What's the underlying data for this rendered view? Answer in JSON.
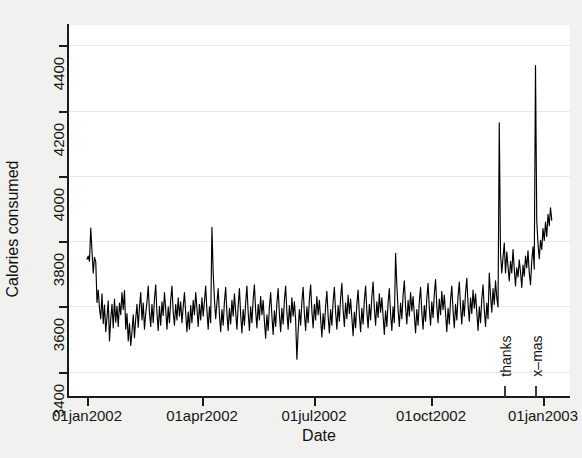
{
  "chart_data": {
    "type": "line",
    "title": "",
    "xlabel": "Date",
    "ylabel": "Calories consumed",
    "grid": true,
    "legend": "none",
    "line_color": "#000000",
    "background_color": "#ffffff",
    "figure_background_color": "#f1f1f0",
    "x_type": "date",
    "xlim": [
      "01jan2002",
      "15jan2003"
    ],
    "ylim": [
      3320,
      4460
    ],
    "y_ticks": [
      3400,
      3600,
      3800,
      4000,
      4200,
      4400
    ],
    "y_tick_labels": [
      "3400",
      "3600",
      "3800",
      "4000",
      "4200",
      "4400"
    ],
    "x_ticks": [
      "01jan2002",
      "01apr2002",
      "01jul2002",
      "01oct2002",
      "01jan2003"
    ],
    "x_tick_labels": [
      "01jan2002",
      "01apr2002",
      "01jul2002",
      "01oct2002",
      "01jan2003"
    ],
    "annotations": [
      {
        "label": "thanks",
        "x": "28nov2002",
        "orientation": "vertical"
      },
      {
        "label": "x–mas",
        "x": "25dec2002",
        "orientation": "vertical"
      }
    ],
    "series": [
      {
        "name": "Calories consumed",
        "x_start": "01jan2002",
        "x_step_days": 1,
        "values": [
          3742,
          3752,
          3736,
          3838,
          3766,
          3700,
          3748,
          3735,
          3610,
          3648,
          3592,
          3560,
          3636,
          3545,
          3602,
          3520,
          3564,
          3615,
          3492,
          3560,
          3604,
          3532,
          3620,
          3549,
          3598,
          3536,
          3608,
          3572,
          3640,
          3588,
          3646,
          3528,
          3576,
          3492,
          3545,
          3478,
          3520,
          3572,
          3502,
          3560,
          3604,
          3534,
          3596,
          3640,
          3556,
          3608,
          3528,
          3576,
          3612,
          3660,
          3580,
          3536,
          3604,
          3548,
          3620,
          3664,
          3576,
          3524,
          3598,
          3540,
          3612,
          3570,
          3640,
          3588,
          3528,
          3596,
          3548,
          3616,
          3660,
          3580,
          3540,
          3604,
          3556,
          3624,
          3568,
          3612,
          3548,
          3596,
          3640,
          3576,
          3520,
          3580,
          3528,
          3600,
          3548,
          3616,
          3572,
          3640,
          3592,
          3536,
          3604,
          3556,
          3624,
          3568,
          3612,
          3660,
          3584,
          3528,
          3596,
          3548,
          3840,
          3700,
          3620,
          3560,
          3608,
          3652,
          3572,
          3520,
          3588,
          3540,
          3612,
          3656,
          3576,
          3524,
          3592,
          3544,
          3616,
          3568,
          3636,
          3580,
          3528,
          3600,
          3652,
          3572,
          3516,
          3588,
          3540,
          3608,
          3660,
          3580,
          3524,
          3596,
          3548,
          3620,
          3664,
          3584,
          3532,
          3604,
          3556,
          3628,
          3572,
          3616,
          3552,
          3500,
          3572,
          3524,
          3596,
          3640,
          3568,
          3512,
          3584,
          3536,
          3608,
          3652,
          3576,
          3520,
          3592,
          3544,
          3616,
          3660,
          3580,
          3528,
          3600,
          3548,
          3624,
          3568,
          3612,
          3556,
          3436,
          3520,
          3588,
          3540,
          3612,
          3656,
          3576,
          3524,
          3596,
          3548,
          3620,
          3664,
          3584,
          3532,
          3604,
          3556,
          3628,
          3572,
          3616,
          3560,
          3504,
          3576,
          3528,
          3600,
          3644,
          3568,
          3516,
          3588,
          3540,
          3612,
          3656,
          3580,
          3528,
          3600,
          3552,
          3624,
          3668,
          3588,
          3536,
          3608,
          3560,
          3632,
          3576,
          3620,
          3564,
          3508,
          3580,
          3532,
          3604,
          3648,
          3572,
          3520,
          3592,
          3544,
          3616,
          3660,
          3584,
          3532,
          3604,
          3556,
          3628,
          3672,
          3592,
          3540,
          3612,
          3564,
          3636,
          3580,
          3624,
          3568,
          3512,
          3584,
          3536,
          3608,
          3652,
          3576,
          3524,
          3596,
          3548,
          3760,
          3664,
          3588,
          3536,
          3608,
          3560,
          3632,
          3676,
          3596,
          3544,
          3616,
          3568,
          3640,
          3584,
          3628,
          3572,
          3516,
          3588,
          3540,
          3612,
          3656,
          3580,
          3528,
          3600,
          3552,
          3624,
          3668,
          3592,
          3540,
          3612,
          3564,
          3636,
          3680,
          3600,
          3548,
          3620,
          3572,
          3644,
          3588,
          3632,
          3576,
          3520,
          3592,
          3544,
          3616,
          3660,
          3584,
          3532,
          3604,
          3556,
          3628,
          3672,
          3596,
          3544,
          3616,
          3568,
          3640,
          3684,
          3604,
          3552,
          3624,
          3576,
          3648,
          3592,
          3636,
          3580,
          3524,
          3596,
          3548,
          3620,
          3664,
          3588,
          3536,
          3608,
          3560,
          3700,
          3632,
          3580,
          3652,
          3604,
          3676,
          3624,
          3596,
          4160,
          3760,
          3700,
          3748,
          3792,
          3700,
          3764,
          3720,
          3676,
          3736,
          3700,
          3772,
          3712,
          3660,
          3716,
          3688,
          3740,
          3704,
          3656,
          3724,
          3690,
          3752,
          3716,
          3768,
          3700,
          3664,
          3736,
          3780,
          3712,
          4336,
          3860,
          3790,
          3744,
          3800,
          3772,
          3836,
          3800,
          3856,
          3812,
          3880,
          3845,
          3900,
          3862
        ]
      }
    ]
  },
  "axes": {
    "y_ticks": [
      {
        "label": "3400",
        "y_px": 372
      },
      {
        "label": "3600",
        "y_px": 306
      },
      {
        "label": "3800",
        "y_px": 241
      },
      {
        "label": "4000",
        "y_px": 176
      },
      {
        "label": "4200",
        "y_px": 111
      },
      {
        "label": "4400",
        "y_px": 45
      }
    ],
    "x_ticks": [
      {
        "label": "01jan2002",
        "x_px": 87
      },
      {
        "label": "01apr2002",
        "x_px": 202
      },
      {
        "label": "01jul2002",
        "x_px": 314
      },
      {
        "label": "01oct2002",
        "x_px": 431
      },
      {
        "label": "01jan2003",
        "x_px": 543
      }
    ],
    "y_title": "Calories consumed",
    "x_title": "Date"
  },
  "events": [
    {
      "name": "thanks",
      "x_px": 504,
      "label_y_px": 348
    },
    {
      "name": "x–mas",
      "x_px": 535,
      "label_y_px": 348
    }
  ]
}
